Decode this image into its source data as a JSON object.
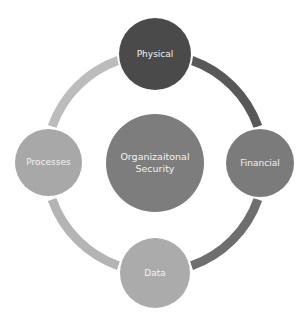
{
  "diagram": {
    "type": "cycle",
    "center": {
      "label": "Organizaitonal Security",
      "line1": "Organizaitonal",
      "line2": "Security",
      "color": "#7d7d7d"
    },
    "nodes": [
      {
        "id": "physical",
        "label": "Physical",
        "position": "top",
        "color": "#4a4a4a"
      },
      {
        "id": "financial",
        "label": "Financial",
        "position": "right",
        "color": "#7b7b7b"
      },
      {
        "id": "data",
        "label": "Data",
        "position": "bottom",
        "color": "#ababab"
      },
      {
        "id": "processes",
        "label": "Processes",
        "position": "left",
        "color": "#a8a8a8"
      }
    ],
    "connectors": [
      {
        "from": "Physical",
        "to": "Financial",
        "color": "#585858"
      },
      {
        "from": "Financial",
        "to": "Data",
        "color": "#6e6e6e"
      },
      {
        "from": "Data",
        "to": "Processes",
        "color": "#b4b4b4"
      },
      {
        "from": "Processes",
        "to": "Physical",
        "color": "#bcbcbc"
      }
    ]
  }
}
